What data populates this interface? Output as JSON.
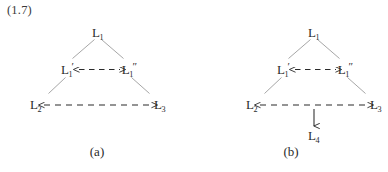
{
  "figure": {
    "equation_number": "(1.7)",
    "background_color": "#ffffff",
    "ink_color": "#2b2b2b",
    "edge_color": "#8a8a8a"
  },
  "panels": [
    {
      "caption": "(a)",
      "nodes": {
        "apex": {
          "base": "L",
          "sub": "1",
          "prime": ""
        },
        "mid_left": {
          "base": "L",
          "sub": "1",
          "prime": "′"
        },
        "mid_right": {
          "base": "L",
          "sub": "1",
          "prime": "″"
        },
        "bottom_left": {
          "base": "L",
          "sub": "2",
          "prime": ""
        },
        "bottom_right": {
          "base": "L",
          "sub": "3",
          "prime": ""
        }
      }
    },
    {
      "caption": "(b)",
      "nodes": {
        "apex": {
          "base": "L",
          "sub": "1",
          "prime": ""
        },
        "mid_left": {
          "base": "L",
          "sub": "1",
          "prime": "′"
        },
        "mid_right": {
          "base": "L",
          "sub": "1",
          "prime": "″"
        },
        "bottom_left": {
          "base": "L",
          "sub": "2",
          "prime": ""
        },
        "bottom_right": {
          "base": "L",
          "sub": "3",
          "prime": ""
        },
        "bottom_extra": {
          "base": "L",
          "sub": "4",
          "prime": ""
        }
      }
    }
  ]
}
